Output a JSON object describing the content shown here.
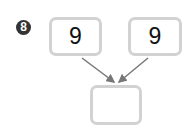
{
  "problem": {
    "number": "8",
    "inputs": [
      {
        "value": "9"
      },
      {
        "value": "9"
      }
    ],
    "result": {
      "value": ""
    }
  },
  "colors": {
    "badge": "#333333",
    "box_border": "#d2d2d2",
    "arrow": "#777777"
  },
  "icons": {
    "arrow_left": "arrow-down-right-icon",
    "arrow_right": "arrow-down-left-icon"
  }
}
